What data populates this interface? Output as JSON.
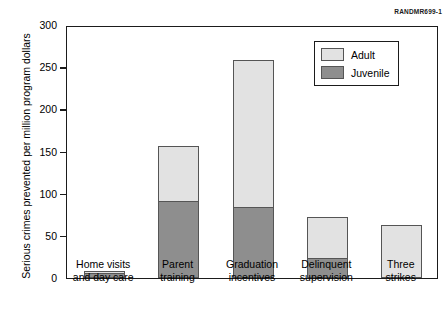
{
  "credit": "RANDMR699-1",
  "chart_data": {
    "type": "bar",
    "subtype": "stacked-vertical",
    "title": "",
    "xlabel": "",
    "ylabel": "Serious crimes prevented per million program dollars",
    "ylim": [
      0,
      300
    ],
    "yticks": [
      0,
      50,
      100,
      150,
      200,
      250,
      300
    ],
    "ytick_labels": [
      "0",
      "50",
      "100",
      "150",
      "200",
      "250",
      "300"
    ],
    "grid": false,
    "legend_position": "top-right",
    "categories": [
      "Home visits and day care",
      "Parent training",
      "Graduation incentives",
      "Delinquent supervision",
      "Three strikes"
    ],
    "category_lines": [
      [
        "Home visits",
        "and day care"
      ],
      [
        "Parent",
        "training"
      ],
      [
        "Graduation",
        "incentives"
      ],
      [
        "Delinquent",
        "supervision"
      ],
      [
        "Three",
        "strikes"
      ]
    ],
    "series": [
      {
        "name": "Juvenile",
        "color": "#8e8e8e",
        "values": [
          6,
          91,
          84,
          24,
          0
        ]
      },
      {
        "name": "Adult",
        "color": "#e2e2e2",
        "values": [
          4,
          67,
          176,
          50,
          63
        ]
      }
    ],
    "totals": [
      10,
      158,
      260,
      74,
      63
    ]
  },
  "legend": {
    "items": [
      {
        "label": "Adult",
        "color": "#e2e2e2"
      },
      {
        "label": "Juvenile",
        "color": "#8e8e8e"
      }
    ]
  }
}
